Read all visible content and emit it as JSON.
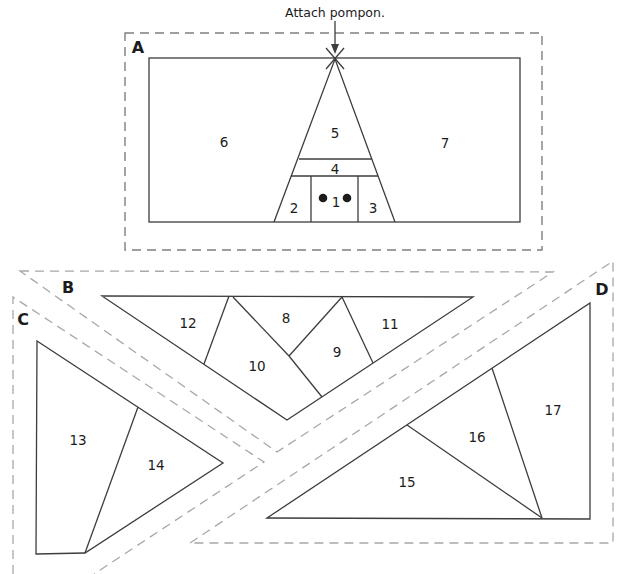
{
  "annotation": {
    "text": "Attach pompon."
  },
  "sections": {
    "a": {
      "label": "A",
      "pieces": {
        "1": "1",
        "2": "2",
        "3": "3",
        "4": "4",
        "5": "5",
        "6": "6",
        "7": "7"
      }
    },
    "b": {
      "label": "B",
      "pieces": {
        "8": "8",
        "9": "9",
        "10": "10",
        "11": "11",
        "12": "12"
      }
    },
    "c": {
      "label": "C",
      "pieces": {
        "13": "13",
        "14": "14"
      }
    },
    "d": {
      "label": "D",
      "pieces": {
        "15": "15",
        "16": "16",
        "17": "17"
      }
    }
  },
  "colors": {
    "background": "#ffffff",
    "line": "#3d3d3d",
    "dash_a": "#7f7f7f",
    "dash": "#a8a8a8",
    "text": "#1c1c1c"
  }
}
